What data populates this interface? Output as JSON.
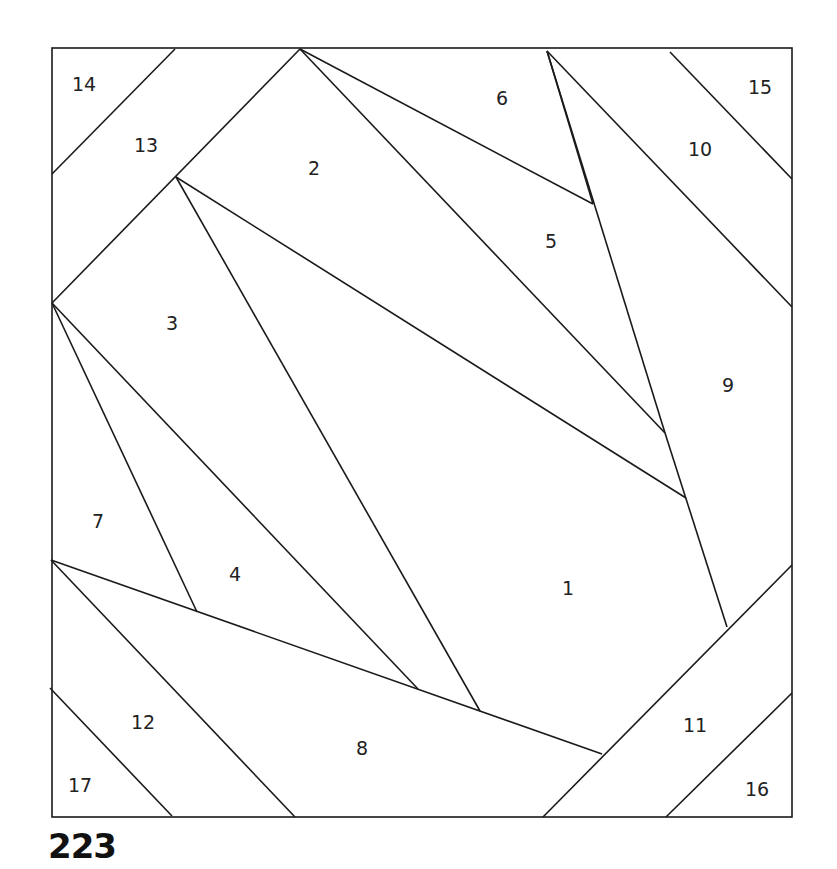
{
  "page_number": "223",
  "diagram": {
    "type": "foundation paper piecing pattern",
    "stroke_color": "#1a1a1a",
    "background": "#ffffff",
    "border": {
      "x1": 52,
      "y1": 48,
      "x2": 792,
      "y2": 817
    },
    "lines": [
      [
        175,
        49,
        52,
        174
      ],
      [
        300,
        49,
        52,
        303
      ],
      [
        300,
        49,
        665,
        433
      ],
      [
        300,
        49,
        593,
        204
      ],
      [
        176,
        177,
        686,
        498
      ],
      [
        176,
        177,
        480,
        711
      ],
      [
        547,
        51,
        665,
        433
      ],
      [
        547,
        51,
        792,
        307
      ],
      [
        670,
        52,
        792,
        179
      ],
      [
        593,
        204,
        547,
        51
      ],
      [
        665,
        433,
        727,
        627
      ],
      [
        52,
        303,
        197,
        612
      ],
      [
        52,
        303,
        418,
        689
      ],
      [
        51,
        560,
        602,
        754
      ],
      [
        51,
        560,
        295,
        817
      ],
      [
        50,
        688,
        172,
        816
      ],
      [
        792,
        565,
        543,
        817
      ],
      [
        792,
        693,
        666,
        817
      ]
    ],
    "pieces": [
      {
        "label": "1",
        "x": 568,
        "y": 595
      },
      {
        "label": "2",
        "x": 314,
        "y": 175
      },
      {
        "label": "3",
        "x": 172,
        "y": 330
      },
      {
        "label": "4",
        "x": 235,
        "y": 581
      },
      {
        "label": "5",
        "x": 551,
        "y": 248
      },
      {
        "label": "6",
        "x": 502,
        "y": 105
      },
      {
        "label": "7",
        "x": 98,
        "y": 528
      },
      {
        "label": "8",
        "x": 362,
        "y": 755
      },
      {
        "label": "9",
        "x": 728,
        "y": 392
      },
      {
        "label": "10",
        "x": 700,
        "y": 156
      },
      {
        "label": "11",
        "x": 695,
        "y": 732
      },
      {
        "label": "12",
        "x": 143,
        "y": 729
      },
      {
        "label": "13",
        "x": 146,
        "y": 152
      },
      {
        "label": "14",
        "x": 84,
        "y": 91
      },
      {
        "label": "15",
        "x": 760,
        "y": 94
      },
      {
        "label": "16",
        "x": 757,
        "y": 796
      },
      {
        "label": "17",
        "x": 80,
        "y": 792
      }
    ]
  }
}
